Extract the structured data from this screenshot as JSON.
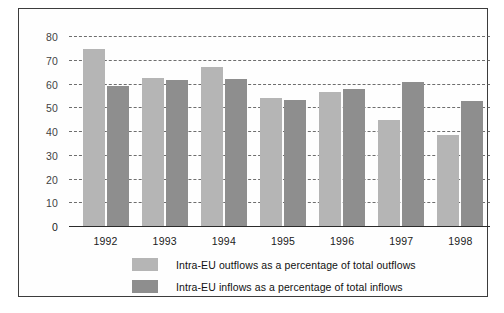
{
  "chart_data": {
    "type": "bar",
    "title": "",
    "subtitle": "",
    "xlabel": "",
    "ylabel": "",
    "categories": [
      "1992",
      "1993",
      "1994",
      "1995",
      "1996",
      "1997",
      "1998"
    ],
    "series": [
      {
        "name": "Intra-EU outflows as a percentage of total outflows",
        "color": "#b5b5b5",
        "values": [
          74.5,
          62.5,
          67.0,
          54.0,
          56.5,
          44.5,
          38.5
        ]
      },
      {
        "name": "Intra-EU inflows as a percentage of total inflows",
        "color": "#8e8e8e",
        "values": [
          59.0,
          61.5,
          62.0,
          53.0,
          57.5,
          60.5,
          52.5
        ]
      }
    ],
    "ylim": [
      0,
      80
    ],
    "ytick_step": 10,
    "yticks": [
      0,
      10,
      20,
      30,
      40,
      50,
      60,
      70,
      80
    ],
    "ytick_labels": [
      "0",
      "10",
      "20",
      "30",
      "40",
      "50",
      "60",
      "70",
      "80"
    ],
    "grid": true,
    "grid_style": "dashed-horizontal",
    "legend_position": "bottom-left",
    "legend": [
      "Intra-EU outflows as a percentage of total outflows",
      "Intra-EU inflows as a percentage of total inflows"
    ],
    "annotations": []
  },
  "colors": {
    "outflows": "#b5b5b5",
    "inflows": "#8e8e8e",
    "grid": "#555555",
    "axis": "#2b2b2b",
    "frame": "#3c3c3c",
    "background": "#ffffff",
    "text": "#1a1a1a"
  }
}
